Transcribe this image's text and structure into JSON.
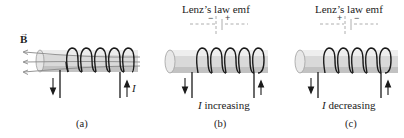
{
  "figure": {
    "panels": [
      {
        "id": "a",
        "field_label": "B",
        "current_label": "I",
        "caption": "(a)",
        "field_lines_count": 3,
        "field_direction": "left",
        "left_arrow": "down",
        "right_arrow": "up"
      },
      {
        "id": "b",
        "emf_title": "Lenz’s law emf",
        "emf_left_sign": "−",
        "emf_right_sign": "+",
        "current_symbol": "I",
        "condition": "increasing",
        "caption": "(b)",
        "left_arrow": "down",
        "right_arrow": "up"
      },
      {
        "id": "c",
        "emf_title": "Lenz’s law emf",
        "emf_left_sign": "+",
        "emf_right_sign": "−",
        "current_symbol": "I",
        "condition": "decreasing",
        "caption": "(c)",
        "left_arrow": "down",
        "right_arrow": "up"
      }
    ],
    "colors": {
      "core_fill": "#d9d9d9",
      "core_shade": "#b8b8b8",
      "wire": "#1a1a1a",
      "field_line": "#8a8a8a",
      "dashed_wire": "#9a9a9a",
      "text": "#222222"
    }
  }
}
